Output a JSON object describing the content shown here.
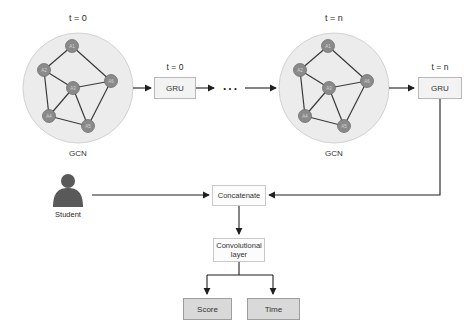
{
  "gcn_t0": {
    "title": "t = 0",
    "caption": "GCN",
    "nodes": [
      "A1",
      "A2",
      "A3",
      "A4",
      "A5",
      "A6"
    ]
  },
  "gru_t0": {
    "title": "t = 0",
    "label": "GRU"
  },
  "ellipsis": "...",
  "gcn_tn": {
    "title": "t = n",
    "caption": "GCN",
    "nodes": [
      "A1",
      "A2",
      "A3",
      "A4",
      "A5",
      "A6"
    ]
  },
  "gru_tn": {
    "title": "t = n",
    "label": "GRU"
  },
  "student": {
    "label": "Student"
  },
  "concatenate": {
    "label": "Concatenate"
  },
  "conv": {
    "label": "Convolutional layer"
  },
  "outputs": {
    "score": "Score",
    "time": "Time"
  },
  "colors": {
    "cluster_fill": "#ececec",
    "cluster_border": "#d2d2d2",
    "node_fill": "#8a8a8a",
    "node_border": "#6f6f6f",
    "node_label": "#d4d4d4",
    "graph_edge": "#3a3a3a",
    "arrow": "#1f1f1f",
    "gru_box_fill": "#f3f3f3",
    "gru_box_border": "#b8b8b8",
    "process_box_fill": "#fcfcfc",
    "process_box_border": "#c9c9c9",
    "output_box_fill": "#d9d9d9",
    "output_box_border": "#9e9e9e",
    "student_icon": "#595959",
    "text": "#2b2b2b"
  }
}
